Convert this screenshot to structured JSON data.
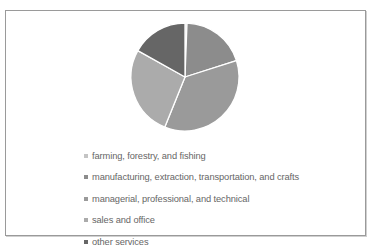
{
  "chart_data": {
    "type": "pie",
    "title": "",
    "categories": [
      "farming, forestry, and fishing",
      "manufacturing, extraction, transportation, and crafts",
      "managerial, professional, and technical",
      "sales and office",
      "other services"
    ],
    "values": [
      0.6,
      19.5,
      36.0,
      27.0,
      16.9
    ],
    "colors": [
      "#c4c4c4",
      "#8c8c8c",
      "#9a9a9a",
      "#ababab",
      "#666666"
    ],
    "start_angle_deg": 0,
    "direction": "clockwise",
    "legend_position": "bottom",
    "center": [
      185,
      77
    ],
    "radius": 54
  },
  "legend": {
    "items": [
      {
        "label": "farming, forestry, and fishing",
        "color": "#c4c4c4"
      },
      {
        "label": "manufacturing, extraction, transportation, and crafts",
        "color": "#8c8c8c"
      },
      {
        "label": "managerial, professional, and technical",
        "color": "#9a9a9a"
      },
      {
        "label": "sales and office",
        "color": "#ababab"
      },
      {
        "label": "other services",
        "color": "#666666"
      }
    ]
  }
}
